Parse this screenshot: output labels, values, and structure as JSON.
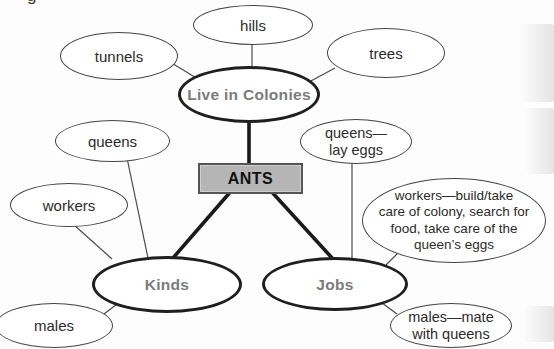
{
  "colors": {
    "background": "#fdfdfd",
    "node_fill": "#ffffff",
    "plain_stroke": "#454545",
    "main_stroke": "#1f1f1f",
    "main_text": "#7b7b7b",
    "ants_fill": "#b5b5b5",
    "ants_border": "#555555",
    "ants_text": "#121212",
    "sub_text": "#2b2b2b",
    "thin_line": "#4a4a4a",
    "thick_line": "#1a1a1a"
  },
  "center_node": {
    "label": "ANTS"
  },
  "main_nodes": {
    "colonies": {
      "label": "Live in Colonies"
    },
    "kinds": {
      "label": "Kinds"
    },
    "jobs": {
      "label": "Jobs"
    }
  },
  "sub_nodes": {
    "hills": {
      "label": "hills"
    },
    "tunnels": {
      "label": "tunnels"
    },
    "trees": {
      "label": "trees"
    },
    "queens": {
      "label": "queens"
    },
    "workers": {
      "label": "workers"
    },
    "males": {
      "label": "males"
    },
    "queens_job": {
      "lines": [
        "queens—",
        "lay eggs"
      ]
    },
    "workers_job": {
      "lines": [
        "workers—build/take",
        "care of colony, search for",
        "food, take care of the",
        "queen’s eggs"
      ]
    },
    "males_job": {
      "lines": [
        "males—mate",
        "with queens"
      ]
    }
  },
  "artifacts": {
    "corner_glyph": "g"
  }
}
